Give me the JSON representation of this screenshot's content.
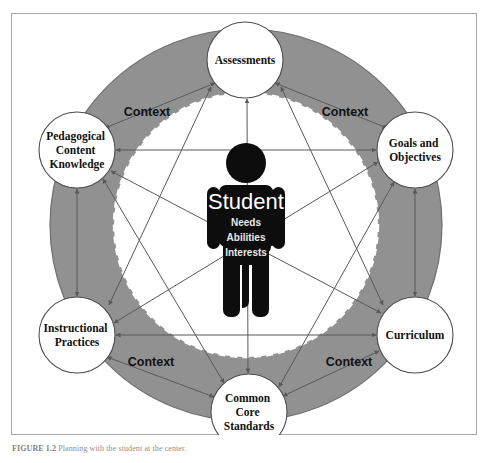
{
  "figure": {
    "caption_label": "FIGURE 1.2",
    "caption_text": "Planning with the student at the center."
  },
  "diagram": {
    "type": "hub-and-spoke concept map",
    "colors": {
      "ring_gray": "#919191",
      "inner_white": "#ffffff",
      "node_fill": "#ffffff",
      "node_stroke": "#4d4d4d",
      "figure_black": "#0d0d0d",
      "arrow_gray": "#595959",
      "frame_border": "#a9a9a9"
    },
    "center": {
      "name": "student-figure",
      "title": "Student",
      "attributes": [
        "Needs",
        "Abilities",
        "Interests"
      ]
    },
    "ring_labels": [
      {
        "id": "context-top-left",
        "text": "Context"
      },
      {
        "id": "context-top-right",
        "text": "Context"
      },
      {
        "id": "context-bottom-left",
        "text": "Context"
      },
      {
        "id": "context-bottom-right",
        "text": "Context"
      }
    ],
    "nodes": [
      {
        "id": "assessments",
        "lines": [
          "Assessments"
        ],
        "cx": 234,
        "cy": 47,
        "r": 38
      },
      {
        "id": "goals-and-objectives",
        "lines": [
          "Goals and",
          "Objectives"
        ],
        "cx": 404,
        "cy": 137,
        "r": 38
      },
      {
        "id": "curriculum",
        "lines": [
          "Curriculum"
        ],
        "cx": 404,
        "cy": 322,
        "r": 38
      },
      {
        "id": "common-core-standards",
        "lines": [
          "Common",
          "Core",
          "Standards"
        ],
        "cx": 238,
        "cy": 399,
        "r": 38
      },
      {
        "id": "instructional-practices",
        "lines": [
          "Instructional",
          "Practices"
        ],
        "cx": 66,
        "cy": 322,
        "r": 38
      },
      {
        "id": "pedagogical-content-knowledge",
        "lines": [
          "Pedagogical",
          "Content",
          "Knowledge"
        ],
        "cx": 66,
        "cy": 137,
        "r": 38
      }
    ],
    "connections": [
      {
        "from": "assessments",
        "to": "goals-and-objectives",
        "bidirectional": true
      },
      {
        "from": "assessments",
        "to": "curriculum",
        "bidirectional": true
      },
      {
        "from": "assessments",
        "to": "common-core-standards",
        "bidirectional": true
      },
      {
        "from": "assessments",
        "to": "instructional-practices",
        "bidirectional": true
      },
      {
        "from": "assessments",
        "to": "pedagogical-content-knowledge",
        "bidirectional": true
      },
      {
        "from": "goals-and-objectives",
        "to": "curriculum",
        "bidirectional": true
      },
      {
        "from": "goals-and-objectives",
        "to": "common-core-standards",
        "bidirectional": true
      },
      {
        "from": "goals-and-objectives",
        "to": "instructional-practices",
        "bidirectional": true
      },
      {
        "from": "goals-and-objectives",
        "to": "pedagogical-content-knowledge",
        "bidirectional": true
      },
      {
        "from": "curriculum",
        "to": "common-core-standards",
        "bidirectional": true
      },
      {
        "from": "curriculum",
        "to": "instructional-practices",
        "bidirectional": true
      },
      {
        "from": "curriculum",
        "to": "pedagogical-content-knowledge",
        "bidirectional": true
      },
      {
        "from": "common-core-standards",
        "to": "instructional-practices",
        "bidirectional": true
      },
      {
        "from": "common-core-standards",
        "to": "pedagogical-content-knowledge",
        "bidirectional": true
      },
      {
        "from": "instructional-practices",
        "to": "pedagogical-content-knowledge",
        "bidirectional": true
      }
    ]
  }
}
